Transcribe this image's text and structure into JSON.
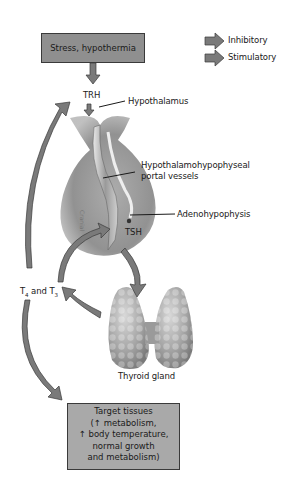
{
  "diagram": {
    "title_box": "Stress, hypothermia",
    "legend": [
      {
        "label": "Inhibitory",
        "color": "#7d7d7d"
      },
      {
        "label": "Stimulatory",
        "color": "#7d7d7d"
      }
    ],
    "labels": {
      "trh": "TRH",
      "hypothalamus": "Hypothalamus",
      "portal_line1": "Hypothalamohypophyseal",
      "portal_line2": "portal vessels",
      "adenohypophysis": "Adenohypophysis",
      "tsh": "TSH",
      "t4_t3_prefix": "T",
      "t4_sub": "4",
      "t4_t3_mid": " and T",
      "t3_sub": "3",
      "thyroid_gland": "Thyroid gland"
    },
    "target_box": {
      "lines": [
        "Target tissues",
        "(↑ metabolism,",
        "↑ body temperature,",
        "normal growth",
        "and metabolism)"
      ]
    },
    "colors": {
      "arrow": "#7a7a7a",
      "arrow_edge": "#3a3a3a",
      "box": "#8f8f8f",
      "target_box": "#a9a9a9",
      "gland": "#a0a0a0"
    }
  }
}
